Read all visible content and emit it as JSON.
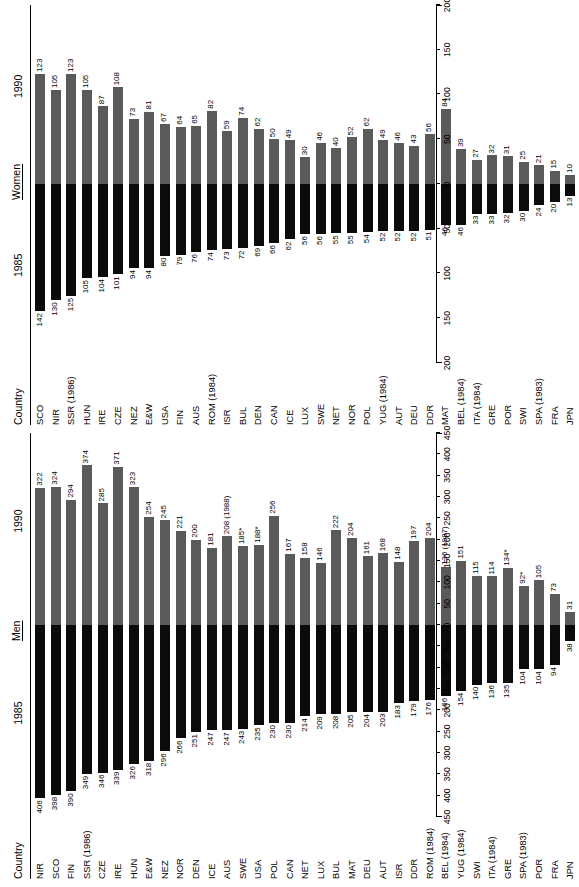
{
  "figure": {
    "panels": [
      {
        "id": "men",
        "title": "Men",
        "country_header": "Country",
        "left_year": "1985",
        "right_year": "1990",
        "axis_ticks": [
          450,
          400,
          350,
          300,
          250,
          200,
          150,
          100,
          50,
          0,
          50,
          100,
          150,
          200,
          250,
          300,
          350,
          400,
          450
        ],
        "axis_max": 450
      },
      {
        "id": "women",
        "title": "Women",
        "country_header": "Country",
        "left_year": "1985",
        "right_year": "1990",
        "axis_ticks": [
          200,
          150,
          100,
          50,
          0,
          50,
          100,
          150,
          200
        ],
        "axis_max": 200
      }
    ],
    "colors": {
      "bar_1985": "#0b0b0b",
      "bar_1990": "#5a5a5a",
      "text": "#000000",
      "background": "#ffffff"
    }
  },
  "chart_data": [
    {
      "type": "bar",
      "title": "Men",
      "orientation": "horizontal-diverging",
      "xlabel": "",
      "ylabel": "Country",
      "xlim": [
        -450,
        450
      ],
      "grid": false,
      "legend": [
        "1985",
        "1990"
      ],
      "legend_position": "column-headers",
      "categories": [
        "NIR",
        "SCO",
        "FIN",
        "SSR (1986)",
        "CZE",
        "IRE",
        "HUN",
        "E&W",
        "NEZ",
        "NOR",
        "DEN",
        "ICE",
        "AUS",
        "SWE",
        "USA",
        "POL",
        "CAN",
        "NET",
        "LUX",
        "BUL",
        "MAT",
        "DEU",
        "AUT",
        "ISR",
        "DDR",
        "ROM (1984)",
        "BEL (1984)",
        "YUG (1984)",
        "SWI",
        "ITA (1984)",
        "GRE",
        "SPA (1983)",
        "POR",
        "FRA",
        "JPN"
      ],
      "series": [
        {
          "name": "1985",
          "values": [
            406,
            398,
            390,
            349,
            346,
            339,
            326,
            318,
            296,
            266,
            251,
            247,
            247,
            243,
            235,
            230,
            230,
            214,
            209,
            208,
            205,
            204,
            203,
            183,
            179,
            176,
            166,
            154,
            140,
            136,
            135,
            104,
            104,
            94,
            38
          ],
          "labels": [
            "406",
            "398",
            "390",
            "349",
            "346",
            "339",
            "326",
            "318",
            "296",
            "266",
            "251",
            "247",
            "247",
            "243",
            "235",
            "230",
            "230",
            "214",
            "209",
            "208",
            "205",
            "204",
            "203",
            "183",
            "179",
            "176",
            "166",
            "154",
            "140",
            "136",
            "135",
            "104",
            "104",
            "94",
            "38"
          ]
        },
        {
          "name": "1990",
          "values": [
            322,
            324,
            294,
            374,
            285,
            371,
            323,
            254,
            245,
            221,
            200,
            181,
            208,
            185,
            188,
            256,
            167,
            158,
            146,
            222,
            204,
            161,
            168,
            148,
            197,
            204,
            136,
            151,
            115,
            114,
            134,
            92,
            105,
            73,
            31
          ],
          "labels": [
            "322",
            "324",
            "294",
            "374",
            "285",
            "371",
            "323",
            "254",
            "245",
            "221",
            "200",
            "181",
            "208 (1988)",
            "185*",
            "188*",
            "256",
            "167",
            "158",
            "146",
            "222",
            "204",
            "161",
            "168",
            "148",
            "197",
            "204",
            "136 (1987)",
            "151",
            "115",
            "114",
            "134*",
            "92*",
            "105",
            "73",
            "31"
          ]
        }
      ]
    },
    {
      "type": "bar",
      "title": "Women",
      "orientation": "horizontal-diverging",
      "xlabel": "",
      "ylabel": "Country",
      "xlim": [
        -200,
        200
      ],
      "grid": false,
      "legend": [
        "1985",
        "1990"
      ],
      "legend_position": "column-headers",
      "categories": [
        "SCO",
        "NIR",
        "SSR (1986)",
        "HUN",
        "IRE",
        "CZE",
        "NEZ",
        "E&W",
        "USA",
        "FIN",
        "AUS",
        "ROM (1984)",
        "ISR",
        "BUL",
        "DEN",
        "CAN",
        "ICE",
        "LUX",
        "SWE",
        "NET",
        "NOR",
        "POL",
        "YUG (1984)",
        "AUT",
        "DEU",
        "DDR",
        "MAT",
        "BEL (1984)",
        "ITA (1984)",
        "GRE",
        "POR",
        "SWI",
        "SPA (1983)",
        "FRA",
        "JPN"
      ],
      "series": [
        {
          "name": "1985",
          "values": [
            142,
            130,
            125,
            105,
            104,
            101,
            94,
            94,
            80,
            79,
            76,
            74,
            73,
            72,
            69,
            66,
            62,
            56,
            56,
            55,
            55,
            54,
            52,
            52,
            52,
            51,
            46,
            46,
            33,
            33,
            32,
            30,
            24,
            20,
            13
          ],
          "labels": [
            "142",
            "130",
            "125",
            "105",
            "104",
            "101",
            "94",
            "94",
            "80",
            "79",
            "76",
            "74",
            "73",
            "72",
            "69",
            "66",
            "62",
            "56",
            "56",
            "55",
            "55",
            "54",
            "52",
            "52",
            "52",
            "51",
            "46",
            "46",
            "33",
            "33",
            "32",
            "30",
            "24",
            "20",
            "13"
          ]
        },
        {
          "name": "1990",
          "values": [
            123,
            105,
            123,
            105,
            87,
            108,
            73,
            81,
            67,
            64,
            65,
            82,
            59,
            74,
            62,
            50,
            49,
            30,
            46,
            40,
            52,
            62,
            49,
            46,
            43,
            56,
            84,
            39,
            27,
            32,
            31,
            25,
            21,
            15,
            10
          ],
          "labels": [
            "123",
            "105",
            "123",
            "105",
            "87",
            "108",
            "73",
            "81",
            "67",
            "64",
            "65",
            "82",
            "59",
            "74",
            "62",
            "50",
            "49",
            "30",
            "46",
            "40",
            "52",
            "62",
            "49",
            "46",
            "43",
            "56",
            "84",
            "39",
            "27",
            "32",
            "31",
            "25",
            "21",
            "15",
            "10"
          ]
        }
      ]
    }
  ]
}
